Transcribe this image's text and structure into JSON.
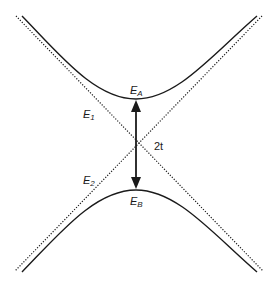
{
  "diagram": {
    "type": "avoided-crossing energy level diagram",
    "curves": [
      {
        "id": "E_A",
        "kind": "upper-hyperbola",
        "style": "solid",
        "vertex": [
          136,
          99
        ]
      },
      {
        "id": "E_B",
        "kind": "lower-hyperbola",
        "style": "solid",
        "vertex": [
          136,
          190
        ]
      },
      {
        "id": "E_1",
        "kind": "diabatic-line",
        "style": "dotted",
        "from": [
          17,
          17
        ],
        "to": [
          262,
          270
        ]
      },
      {
        "id": "E_2",
        "kind": "diabatic-line",
        "style": "dotted",
        "from": [
          262,
          17
        ],
        "to": [
          17,
          270
        ]
      }
    ],
    "arrow": {
      "kind": "double-headed",
      "from": [
        136,
        101
      ],
      "to": [
        136,
        188
      ],
      "label": "2t"
    },
    "crossing_point": [
      136,
      144
    ]
  },
  "labels": {
    "ea": {
      "base": "E",
      "sub": "A"
    },
    "eb": {
      "base": "E",
      "sub": "B"
    },
    "e1": {
      "base": "E",
      "sub": "1"
    },
    "e2": {
      "base": "E",
      "sub": "2"
    },
    "gap": "2t"
  },
  "colors": {
    "line": "#1a1a1a",
    "background": "#ffffff"
  }
}
